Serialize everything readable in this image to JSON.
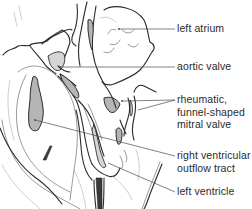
{
  "figure": {
    "labels": [
      {
        "id": "left-atrium",
        "lines": [
          "left atrium"
        ]
      },
      {
        "id": "aortic-valve",
        "lines": [
          "aortic valve"
        ]
      },
      {
        "id": "mitral-valve",
        "lines": [
          "rheumatic,",
          "funnel-shaped",
          "mitral valve"
        ]
      },
      {
        "id": "rv-outflow-tract",
        "lines": [
          "right ventricular",
          "outflow tract"
        ]
      },
      {
        "id": "left-ventricle",
        "lines": [
          "left ventricle"
        ]
      }
    ]
  },
  "colors": {
    "ink": "#2a2a2a",
    "shading": "#b5b5b5",
    "background": "#ffffff"
  }
}
